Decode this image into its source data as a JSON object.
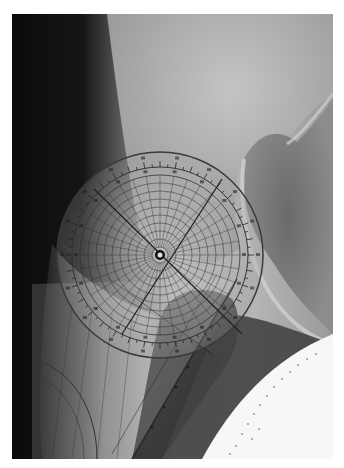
{
  "image": {
    "description": "Radiograph of a hip joint with a transparent protractor / goniometer overlay",
    "subject": "hip-xray",
    "overlay": "protractor",
    "frame": {
      "x": 12,
      "y": 14,
      "width": 321,
      "height": 445
    },
    "protractor": {
      "center_x": 148,
      "center_y": 241,
      "outer_radius": 103,
      "rings": 9,
      "spokes": 36
    },
    "colors": {
      "background": "#ffffff",
      "soft_tissue_dark": "#0d0d0d",
      "bone_light": "#b9b9b9",
      "joint_space": "#6e6e6e",
      "protractor_line": "#2a2a2a",
      "paper_white": "#f7f7f7"
    }
  }
}
